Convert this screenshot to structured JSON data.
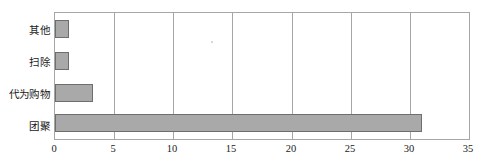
{
  "chart_data": {
    "type": "bar",
    "orientation": "horizontal",
    "title": "",
    "subtitle": "",
    "xlabel": "",
    "ylabel": "",
    "categories": [
      "团聚",
      "代为购物",
      "扫除",
      "其他"
    ],
    "values": [
      31,
      3.2,
      1.2,
      1.2
    ],
    "xlim": [
      0,
      35
    ],
    "xticks": [
      0,
      5,
      10,
      15,
      20,
      25,
      30,
      35
    ],
    "xtick_labels": [
      "0",
      "5",
      "10",
      "15",
      "20",
      "25",
      "30",
      "35"
    ],
    "grid": {
      "vertical": true,
      "horizontal": false
    },
    "legend": {
      "visible": false,
      "position": "none"
    },
    "colors": {
      "bar_fill": "#a9a9a9",
      "bar_border": "#6e6e6e",
      "axis": "#a6a6a6",
      "gridline": "#a6a6a6",
      "text": "#1a1a1a",
      "background": "#ffffff"
    },
    "series": [
      {
        "name": "",
        "values": [
          31,
          3.2,
          1.2,
          1.2
        ]
      }
    ],
    "bars": [
      {
        "label": "其他",
        "value": 1.2
      },
      {
        "label": "扫除",
        "value": 1.2
      },
      {
        "label": "代为购物",
        "value": 3.2
      },
      {
        "label": "团聚",
        "value": 31
      }
    ]
  }
}
